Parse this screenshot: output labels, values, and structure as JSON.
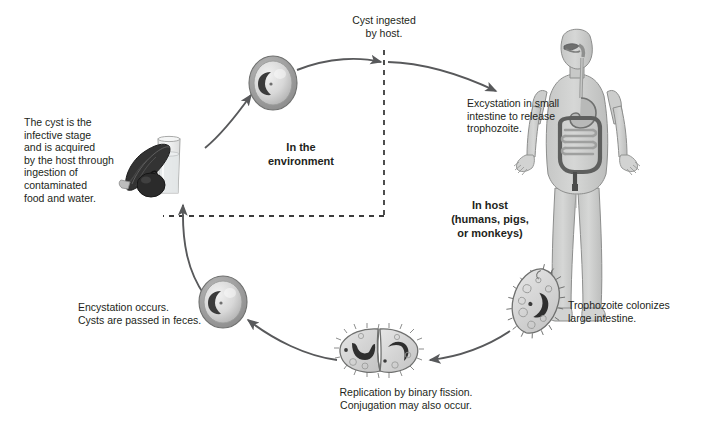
{
  "figure": {
    "background_color": "#ffffff",
    "text_color": "#231f20",
    "stroke_color": "#58595b",
    "cell_fill": "#d9d9d9",
    "nucleus_color": "#3b3b3b",
    "body_fill": "#cfd0cf"
  },
  "zones": {
    "environment": {
      "label": "In the\nenvironment"
    },
    "host": {
      "label": "In host\n(humans, pigs,\nor monkeys)"
    }
  },
  "captions": {
    "cyst_infective": "The cyst is the\ninfective stage\nand is acquired\nby the host through\ningestion of\ncontaminated\nfood and water.",
    "cyst_ingested": "Cyst ingested\nby host.",
    "excystation": "Excystation in small\nintestine to release\ntrophozoite.",
    "trophozoite_colonizes": "Trophozoite colonizes\nlarge intestine.",
    "replication": "Replication by binary fission.\nConjugation may also occur.",
    "encystation": "Encystation occurs.\nCysts are passed in feces."
  },
  "stages": [
    {
      "id": "cyst-environment",
      "name": "cyst",
      "shape": "round cyst with crescent macronucleus"
    },
    {
      "id": "trophozoite",
      "name": "trophozoite",
      "shape": "ciliated pear-shaped cell with macronucleus"
    },
    {
      "id": "dividing-cells",
      "name": "binary-fission-pair",
      "shape": "two attached ciliated cells"
    },
    {
      "id": "cyst-feces",
      "name": "cyst",
      "shape": "round cyst with crescent macronucleus"
    }
  ],
  "icons": {
    "contaminated_food": "leafy-vegetable-and-water-glass-icon",
    "host_body": "human-digestive-system-icon"
  }
}
